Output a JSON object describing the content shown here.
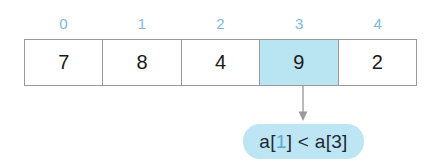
{
  "figure": {
    "colors": {
      "index_label": "#7fb8dd",
      "highlight_cell": "#b9e4f2",
      "pill_background": "#bde5f3",
      "pill_text": "#1f2933",
      "pill_accent": "#5aa9d6",
      "cell_border": "#9a9a9a",
      "arrow": "#8c8c8c",
      "background": "#ffffff"
    }
  },
  "indices": [
    {
      "label": "0"
    },
    {
      "label": "1"
    },
    {
      "label": "2"
    },
    {
      "label": "3"
    },
    {
      "label": "4"
    }
  ],
  "array": {
    "cells": [
      {
        "value": "7",
        "index": "0",
        "highlighted": false
      },
      {
        "value": "8",
        "index": "1",
        "highlighted": false
      },
      {
        "value": "4",
        "index": "2",
        "highlighted": false
      },
      {
        "value": "9",
        "index": "3",
        "highlighted": true
      },
      {
        "value": "2",
        "index": "4",
        "highlighted": false
      }
    ]
  },
  "annotation": {
    "pointer_from_index": "3",
    "expression": {
      "prefix": "a[",
      "accent": "1",
      "suffix": "] < a[3]"
    },
    "full_text": "a[1] < a[3]"
  }
}
